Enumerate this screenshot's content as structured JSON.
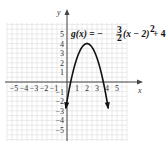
{
  "chart_data": {
    "type": "line",
    "equation": {
      "lhs": "g(x) = −",
      "frac_num": "3",
      "frac_den": "2",
      "rhs": "(x − 2)",
      "exp": "2",
      "tail": " + 4"
    },
    "xlabel": "x",
    "ylabel": "y",
    "xlim": [
      -5.5,
      5.5
    ],
    "ylim": [
      -6.2,
      6
    ],
    "grid": true,
    "x_ticks": [
      "-5",
      "-4",
      "-3",
      "-2",
      "-1",
      "1",
      "2",
      "3",
      "4",
      "5"
    ],
    "y_ticks": [
      "5",
      "4",
      "3",
      "2",
      "1",
      "-1",
      "-2",
      "-3",
      "-4",
      "-5"
    ],
    "series": [
      {
        "name": "g(x)",
        "function": "-1.5*(x-2)^2+4",
        "vertex": [
          2,
          4
        ],
        "x_intercepts": [
          0.37,
          3.63
        ],
        "y_intercept": -2,
        "x": [
          -0.1,
          0,
          0.37,
          1,
          2,
          3,
          3.63,
          4,
          4.1
        ],
        "y": [
          -2.6,
          -2,
          0,
          2.5,
          4,
          2.5,
          0,
          -2,
          -2.6
        ]
      }
    ]
  }
}
